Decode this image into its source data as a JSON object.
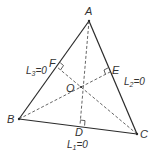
{
  "diagram": {
    "colors": {
      "stroke": "#2a2a2a",
      "dashed": "#555555",
      "text": "#333333"
    },
    "points": {
      "A": {
        "label": "A",
        "x": 89,
        "y": 21
      },
      "B": {
        "label": "B",
        "x": 19,
        "y": 119
      },
      "C": {
        "label": "C",
        "x": 137,
        "y": 134
      },
      "D": {
        "label": "D",
        "x": 80,
        "y": 125
      },
      "E": {
        "label": "E",
        "x": 110,
        "y": 72
      },
      "F": {
        "label": "F",
        "x": 57,
        "y": 67
      },
      "O": {
        "label": "O",
        "x": 81,
        "y": 87
      }
    },
    "lines": {
      "L1": {
        "name": "L",
        "sub": "1",
        "eq": "=0",
        "side": "BC"
      },
      "L2": {
        "name": "L",
        "sub": "2",
        "eq": "=0",
        "side": "AC"
      },
      "L3": {
        "name": "L",
        "sub": "3",
        "eq": "=0",
        "side": "AB"
      }
    }
  }
}
